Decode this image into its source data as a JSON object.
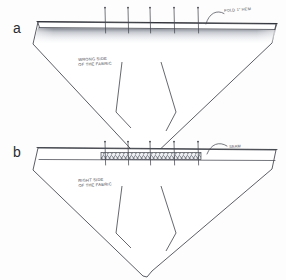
{
  "figure": {
    "background_color": "#fdfdfd",
    "ink_color": "#3a3a42",
    "pencil_shade_color": "#8f94a0"
  },
  "panels": [
    {
      "id": "a",
      "label": "a",
      "surface_note": "WRONG SIDE\nOF THE FABRIC",
      "edge_note": "FOLD 1\" HEM",
      "top_edge_treatment": "pencil-shaded folded hem",
      "pin_count": 5,
      "dart_count": 2
    },
    {
      "id": "b",
      "label": "b",
      "surface_note": "RIGHT SIDE\nOF THE FABRIC",
      "edge_note": "SEAM",
      "top_edge_treatment": "cross-hatched stitched band",
      "pin_count": 5,
      "dart_count": 2
    }
  ],
  "geometry": {
    "panel_a": {
      "outline_points": "36,23 98,19 262,20 281,26 272,44 196,118 156,156 145,162 131,152 96,116 32,45",
      "top_edge": {
        "x1": 38,
        "y1": 22,
        "x2": 276,
        "y2": 24
      },
      "hem_line": {
        "x1": 38,
        "y1": 27,
        "x2": 276,
        "y2": 29
      },
      "shade_band": {
        "x": 36,
        "y": 28,
        "w": 242,
        "h": 16
      },
      "pins_x": [
        105,
        128,
        150,
        174,
        198
      ],
      "pin_top_y": 8,
      "pin_bottom_y": 33,
      "dart_left": "120,63 119,110 147,118",
      "dart_right": "164,63 177,110 147,118",
      "pointer_path": "M 209,20 C 212,11 219,9 224,13"
    },
    "panel_b": {
      "outline_points": "36,147 98,143 262,144 281,150 272,168 196,242 156,280 145,286 131,276 96,240 32,169",
      "top_edge": {
        "x1": 38,
        "y1": 146,
        "x2": 276,
        "y2": 148
      },
      "hem_line": {
        "x1": 38,
        "y1": 151,
        "x2": 276,
        "y2": 153
      },
      "stitch_band": {
        "x": 101,
        "y": 152,
        "w": 100,
        "h": 7
      },
      "pins_x": [
        105,
        128,
        150,
        174,
        198
      ],
      "pin_top_y": 142,
      "pin_bottom_y": 164,
      "dart_left": "120,187 119,234 147,242",
      "dart_right": "164,187 177,234 147,242",
      "pointer_path": "M 207,152 C 211,143 219,141 226,146"
    }
  }
}
